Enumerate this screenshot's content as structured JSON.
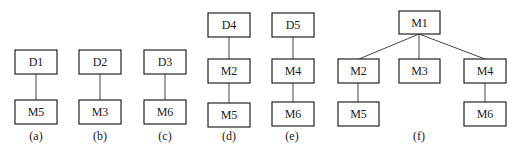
{
  "diagram": {
    "panels": [
      {
        "caption": "(a)",
        "nodes": [
          "D1",
          "M5"
        ]
      },
      {
        "caption": "(b)",
        "nodes": [
          "D2",
          "M3"
        ]
      },
      {
        "caption": "(c)",
        "nodes": [
          "D3",
          "M6"
        ]
      },
      {
        "caption": "(d)",
        "nodes": [
          "D4",
          "M2",
          "M5"
        ]
      },
      {
        "caption": "(e)",
        "nodes": [
          "D5",
          "M4",
          "M6"
        ]
      },
      {
        "caption": "(f)",
        "nodes": [
          "M1",
          "M2",
          "M3",
          "M4",
          "M5",
          "M6"
        ]
      }
    ],
    "edges": {
      "a": [
        [
          "D1",
          "M5"
        ]
      ],
      "b": [
        [
          "D2",
          "M3"
        ]
      ],
      "c": [
        [
          "D3",
          "M6"
        ]
      ],
      "d": [
        [
          "D4",
          "M2"
        ],
        [
          "M2",
          "M5"
        ]
      ],
      "e": [
        [
          "D5",
          "M4"
        ],
        [
          "M4",
          "M6"
        ]
      ],
      "f": [
        [
          "M1",
          "M2"
        ],
        [
          "M1",
          "M3"
        ],
        [
          "M1",
          "M4"
        ],
        [
          "M2",
          "M5"
        ],
        [
          "M4",
          "M6"
        ]
      ]
    },
    "colors": {
      "stroke": "#222222",
      "background": "#ffffff"
    }
  }
}
